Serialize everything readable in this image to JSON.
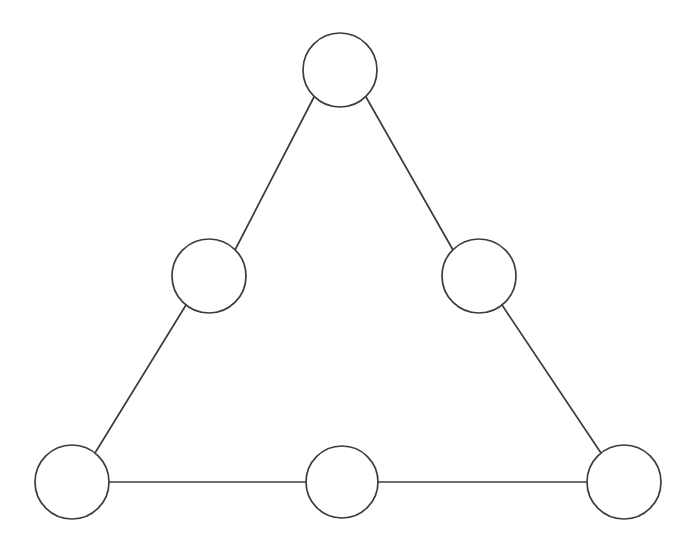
{
  "canvas": {
    "width": 694,
    "height": 552,
    "background_color": "#ffffff"
  },
  "style": {
    "stroke_color": "#3c3c3c",
    "node_fill_color": "#ffffff",
    "stroke_width": 1.7,
    "node_radius": 37
  },
  "diagram": {
    "type": "node-link-graph",
    "shape": "triangle",
    "node_count": 6,
    "edge_count": 6,
    "node_label_text": ""
  },
  "nodes": [
    {
      "id": "top",
      "name": "node-top",
      "cx": 340,
      "cy": 70,
      "r": 37,
      "label": ""
    },
    {
      "id": "mid-left",
      "name": "node-mid-left",
      "cx": 209,
      "cy": 276,
      "r": 37,
      "label": ""
    },
    {
      "id": "mid-right",
      "name": "node-mid-right",
      "cx": 479,
      "cy": 276,
      "r": 37,
      "label": ""
    },
    {
      "id": "bottom-left",
      "name": "node-bottom-left",
      "cx": 72,
      "cy": 482,
      "r": 37,
      "label": ""
    },
    {
      "id": "bottom-center",
      "name": "node-bottom-center",
      "cx": 342,
      "cy": 482,
      "r": 36,
      "label": ""
    },
    {
      "id": "bottom-right",
      "name": "node-bottom-right",
      "cx": 624,
      "cy": 482,
      "r": 37,
      "label": ""
    }
  ],
  "edges": [
    {
      "id": "e1",
      "name": "edge-top-to-mid-left",
      "from": "top",
      "to": "mid-left",
      "x1": 314,
      "y1": 97,
      "x2": 235,
      "y2": 250
    },
    {
      "id": "e2",
      "name": "edge-top-to-mid-right",
      "from": "top",
      "to": "mid-right",
      "x1": 366,
      "y1": 97,
      "x2": 453,
      "y2": 250
    },
    {
      "id": "e3",
      "name": "edge-mid-left-to-bottom-left",
      "from": "mid-left",
      "to": "bottom-left",
      "x1": 186,
      "y1": 305,
      "x2": 95,
      "y2": 453
    },
    {
      "id": "e4",
      "name": "edge-mid-right-to-bottom-right",
      "from": "mid-right",
      "to": "bottom-right",
      "x1": 502,
      "y1": 305,
      "x2": 601,
      "y2": 453
    },
    {
      "id": "e5",
      "name": "edge-bottom-left-to-bottom-center",
      "from": "bottom-left",
      "to": "bottom-center",
      "x1": 109,
      "y1": 482,
      "x2": 306,
      "y2": 482
    },
    {
      "id": "e6",
      "name": "edge-bottom-center-to-bottom-right",
      "from": "bottom-center",
      "to": "bottom-right",
      "x1": 378,
      "y1": 482,
      "x2": 587,
      "y2": 482
    }
  ]
}
